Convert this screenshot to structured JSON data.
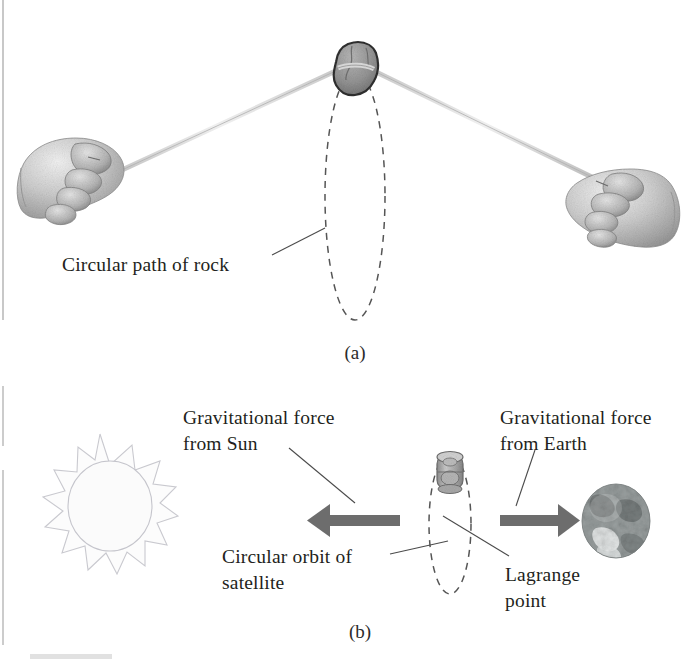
{
  "figure": {
    "panel_a": {
      "panel_label": "(a)",
      "callouts": [
        {
          "name": "circular-path-of-rock",
          "text": "Circular path of rock"
        }
      ],
      "objects": [
        {
          "name": "rock",
          "icon": "rock-icon"
        },
        {
          "name": "left-hand",
          "icon": "fist-hand-icon"
        },
        {
          "name": "right-hand",
          "icon": "fist-hand-icon"
        },
        {
          "name": "string-left",
          "icon": "string-icon"
        },
        {
          "name": "string-right",
          "icon": "string-icon"
        },
        {
          "name": "rock-orbit",
          "icon": "dashed-ellipse-icon"
        }
      ]
    },
    "panel_b": {
      "panel_label": "(b)",
      "callouts": [
        {
          "name": "gravitational-force-from-sun",
          "line1": "Gravitational force",
          "line2": "from Sun"
        },
        {
          "name": "gravitational-force-from-earth",
          "line1": "Gravitational force",
          "line2": "from Earth"
        },
        {
          "name": "circular-orbit-of-satellite",
          "line1": "Circular orbit of",
          "line2": "satellite"
        },
        {
          "name": "lagrange-point",
          "line1": "Lagrange",
          "line2": "point"
        }
      ],
      "objects": [
        {
          "name": "sun",
          "icon": "sun-icon"
        },
        {
          "name": "earth",
          "icon": "earth-globe-icon"
        },
        {
          "name": "satellite",
          "icon": "satellite-icon"
        },
        {
          "name": "satellite-orbit",
          "icon": "dashed-ellipse-icon"
        },
        {
          "name": "force-arrow-toward-sun",
          "icon": "left-arrow-icon"
        },
        {
          "name": "force-arrow-toward-earth",
          "icon": "right-arrow-icon"
        }
      ]
    },
    "colors": {
      "text": "#231f20",
      "arrow": "#6d6d6d",
      "orbit_dash": "#555555",
      "leader": "#4b4b4b",
      "rock": "#8a8a8a",
      "background": "#ffffff"
    }
  }
}
